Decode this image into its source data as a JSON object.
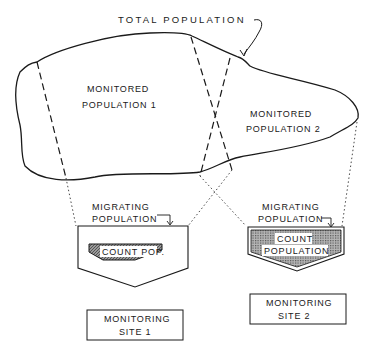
{
  "diagram": {
    "total_population_label": "TOTAL POPULATION",
    "region1": {
      "line1": "MONITORED",
      "line2": "POPULATION 1"
    },
    "region2": {
      "line1": "MONITORED",
      "line2": "POPULATION 2"
    },
    "site1": {
      "migrating_line1": "MIGRATING",
      "migrating_line2": "POPULATION",
      "count_label": "COUNT POP.",
      "site_line1": "MONITORING",
      "site_line2": "SITE 1"
    },
    "site2": {
      "migrating_line1": "MIGRATING",
      "migrating_line2": "POPULATION",
      "count_line1": "COUNT",
      "count_line2": "POPULATION",
      "site_line1": "MONITORING",
      "site_line2": "SITE 2"
    },
    "colors": {
      "ink": "#1a1a1a",
      "shade": "#8a8a8a",
      "shade_dark": "#555555",
      "background": "#ffffff"
    }
  }
}
